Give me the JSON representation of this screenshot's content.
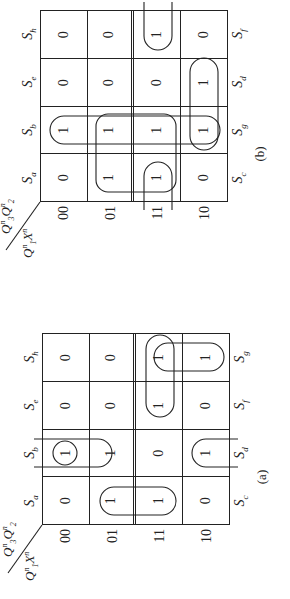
{
  "figure": {
    "type": "karnaugh-maps",
    "maps": [
      {
        "id": "b",
        "caption": "(b)",
        "axis_top": "Q3nQ2n",
        "axis_left": "Q1nXn",
        "column_codes": [
          "00",
          "01",
          "11",
          "10"
        ],
        "row_codes": [
          "00",
          "01",
          "11",
          "10"
        ],
        "column_states_top": [
          "a",
          "b",
          "e",
          "h"
        ],
        "column_states_bottom": [
          "c",
          "g",
          "d",
          "f"
        ],
        "cells": [
          [
            "0",
            "1",
            "0",
            "0"
          ],
          [
            "1",
            "1",
            "0",
            "0"
          ],
          [
            "1",
            "1",
            "0",
            "1"
          ],
          [
            "0",
            "1",
            "1",
            "0"
          ]
        ]
      },
      {
        "id": "a",
        "caption": "(a)",
        "axis_top": "Q3nQ2n",
        "axis_left": "Q1nXn",
        "column_codes": [
          "00",
          "01",
          "11",
          "10"
        ],
        "row_codes": [
          "00",
          "01",
          "11",
          "10"
        ],
        "column_states_top": [
          "a",
          "b",
          "e",
          "h"
        ],
        "column_states_bottom": [
          "c",
          "d",
          "f",
          "g"
        ],
        "cells": [
          [
            "0",
            "1",
            "0",
            "0"
          ],
          [
            "1",
            "1",
            "0",
            "0"
          ],
          [
            "1",
            "0",
            "1",
            "1"
          ],
          [
            "0",
            "1",
            "0",
            "1"
          ]
        ]
      }
    ]
  },
  "labels": {
    "state_prefix": "S",
    "axis_top_main": "Q",
    "axis_top_sub1": "3",
    "axis_top_sub2": "2",
    "axis_left_main1": "Q",
    "axis_left_sub1": "1",
    "axis_left_main2": "X",
    "superscript": "n"
  }
}
